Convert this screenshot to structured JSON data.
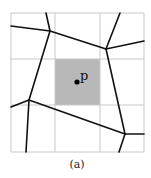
{
  "figure": {
    "caption": "(a)",
    "point_label": "p",
    "colors": {
      "grid": "#c8c8c8",
      "highlight_cell": "#b8b8b8",
      "edges": "#111111",
      "point": "#000000"
    },
    "grid": {
      "rows": 3,
      "cols": 3,
      "x_lines": [
        11,
        55,
        100,
        144
      ],
      "y_lines": [
        13,
        59,
        105,
        152
      ],
      "highlighted_cell": {
        "row": 1,
        "col": 1
      }
    },
    "point": {
      "x": 77,
      "y": 82
    },
    "voronoi_vertices": [
      {
        "id": "A",
        "x": 50,
        "y": 31
      },
      {
        "id": "B",
        "x": 106,
        "y": 49
      },
      {
        "id": "C",
        "x": 29,
        "y": 100
      },
      {
        "id": "D",
        "x": 125,
        "y": 134
      }
    ],
    "voronoi_edges": [
      {
        "from": "A",
        "to": "B"
      },
      {
        "from": "B",
        "to": "D"
      },
      {
        "from": "D",
        "to": "C"
      },
      {
        "from": "C",
        "to": "A"
      },
      {
        "from": "A",
        "to": [
          46,
          13
        ]
      },
      {
        "from": "A",
        "to": [
          11,
          26
        ]
      },
      {
        "from": "B",
        "to": [
          120,
          13
        ]
      },
      {
        "from": "B",
        "to": [
          144,
          41
        ]
      },
      {
        "from": "C",
        "to": [
          11,
          107
        ]
      },
      {
        "from": "C",
        "to": [
          26,
          152
        ]
      },
      {
        "from": "D",
        "to": [
          144,
          134
        ]
      },
      {
        "from": "D",
        "to": [
          119,
          152
        ]
      }
    ]
  }
}
